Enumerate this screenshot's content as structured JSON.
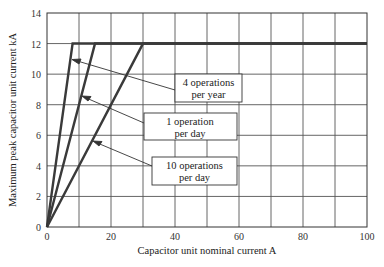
{
  "chart_data": {
    "type": "line",
    "title": "",
    "xlabel": "Capacitor unit nominal current A",
    "ylabel": "Maximum peak capacitor unit current kA",
    "xlim": [
      0,
      100
    ],
    "ylim": [
      0,
      14
    ],
    "xticks": [
      0,
      20,
      40,
      60,
      80,
      100
    ],
    "yticks": [
      0,
      2,
      4,
      6,
      8,
      10,
      12,
      14
    ],
    "grid": true,
    "grid_x_step": 10,
    "grid_y_step": 2,
    "series": [
      {
        "name": "4 operations per year",
        "x": [
          0,
          8,
          100
        ],
        "y": [
          0,
          12,
          12
        ]
      },
      {
        "name": "1 operation per day",
        "x": [
          0,
          15,
          100
        ],
        "y": [
          0,
          12,
          12
        ]
      },
      {
        "name": "10 operations per day",
        "x": [
          0,
          30,
          100
        ],
        "y": [
          0,
          12,
          12
        ]
      }
    ],
    "annotations": [
      {
        "line1": "4 operations",
        "line2": "per year",
        "arrow_to": [
          8.5,
          10.8
        ]
      },
      {
        "line1": "1 operation",
        "line2": "per day",
        "arrow_to": [
          12,
          8.4
        ]
      },
      {
        "line1": "10 operations",
        "line2": "per day",
        "arrow_to": [
          20,
          5.8
        ]
      }
    ]
  },
  "labels": {
    "xlabel": "Capacitor unit nominal current A",
    "ylabel": "Maximum peak capacitor unit current kA",
    "xticks": [
      "0",
      "20",
      "40",
      "60",
      "80",
      "100"
    ],
    "yticks": [
      "0",
      "2",
      "4",
      "6",
      "8",
      "10",
      "12",
      "14"
    ],
    "annotations": [
      {
        "line1": "4 operations",
        "line2": "per year"
      },
      {
        "line1": "1 operation",
        "line2": "per day"
      },
      {
        "line1": "10 operations",
        "line2": "per day"
      }
    ]
  }
}
